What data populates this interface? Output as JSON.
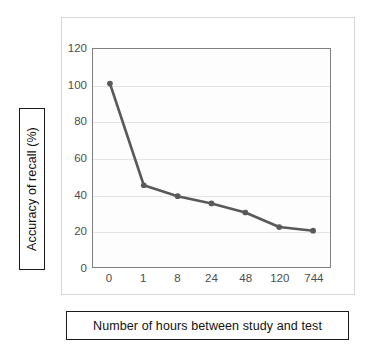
{
  "axis_label_boxes": {
    "y_caption": "Accuracy of recall (%)",
    "x_caption": "Number of hours between study and test"
  },
  "chart_data": {
    "type": "line",
    "title": "",
    "subtitle": "",
    "xlabel": "Number of hours between study and test",
    "ylabel": "Accuracy of recall (%)",
    "categories": [
      "0",
      "1",
      "8",
      "24",
      "48",
      "120",
      "744"
    ],
    "values": [
      101,
      45,
      39,
      35,
      30,
      22,
      20
    ],
    "series": [
      {
        "name": "Accuracy of recall",
        "values": [
          101,
          45,
          39,
          35,
          30,
          22,
          20
        ]
      }
    ],
    "yticks": [
      0,
      20,
      40,
      60,
      80,
      100,
      120
    ],
    "ylim": [
      0,
      120
    ],
    "xtick_labels": [
      "0",
      "1",
      "8",
      "24",
      "48",
      "120",
      "744"
    ],
    "grid": "horizontal",
    "legend": "none",
    "markers": true,
    "colors": {
      "line": "#595959",
      "marker": "#595959",
      "gridline": "#e4e4e4",
      "plot_border": "#808080",
      "plot_background": "#fdfdfd",
      "card_border": "#d7d7d7",
      "tick_text": "#4d4d4d",
      "caption_text": "#111111",
      "caption_border": "#1a1a1a"
    }
  }
}
